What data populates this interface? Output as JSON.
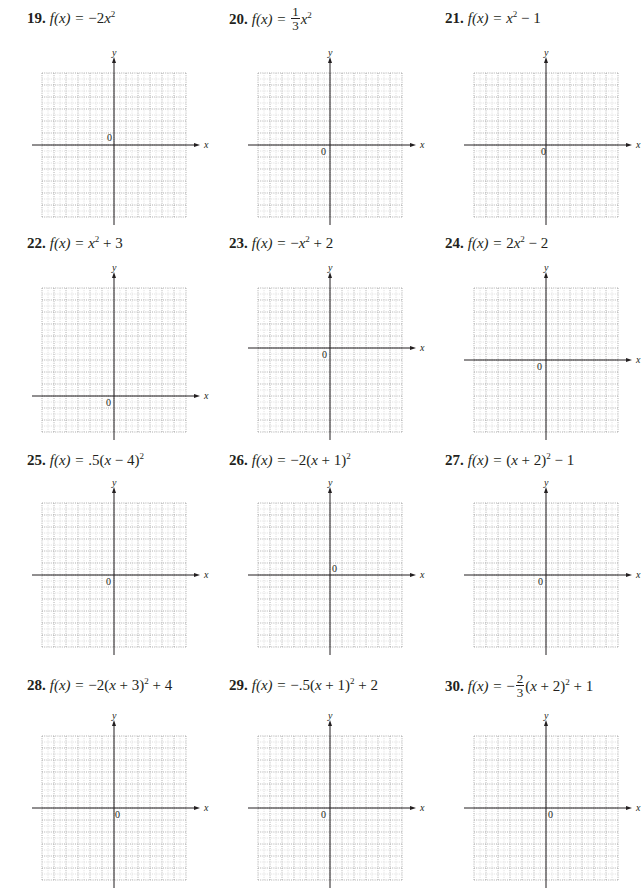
{
  "page": {
    "problems": [
      {
        "number": "19.",
        "lhs": "f(x) =",
        "parts": [
          "−2",
          "x",
          "2",
          ""
        ],
        "frac": null
      },
      {
        "number": "20.",
        "lhs": "f(x) =",
        "parts": [
          "",
          "x",
          "2",
          ""
        ],
        "frac": {
          "num": "1",
          "den": "3",
          "sign": ""
        }
      },
      {
        "number": "21.",
        "lhs": "f(x) =",
        "parts": [
          "",
          "x",
          "2",
          " − 1"
        ],
        "frac": null
      },
      {
        "number": "22.",
        "lhs": "f(x) =",
        "parts": [
          "",
          "x",
          "2",
          " + 3"
        ],
        "frac": null
      },
      {
        "number": "23.",
        "lhs": "f(x) =",
        "parts": [
          "−",
          "x",
          "2",
          " + 2"
        ],
        "frac": null
      },
      {
        "number": "24.",
        "lhs": "f(x) =",
        "parts": [
          "2",
          "x",
          "2",
          " − 2"
        ],
        "frac": null
      },
      {
        "number": "25.",
        "lhs": "f(x) =",
        "parts": [
          ".5(",
          "x",
          "2",
          ""
        ],
        "frac": null,
        "inner": " − 4)"
      },
      {
        "number": "26.",
        "lhs": "f(x) =",
        "parts": [
          "−2(",
          "x",
          "2",
          ""
        ],
        "frac": null,
        "inner": " + 1)"
      },
      {
        "number": "27.",
        "lhs": "f(x) =",
        "parts": [
          "(",
          "x",
          "2",
          " − 1"
        ],
        "frac": null,
        "inner": " + 2)"
      },
      {
        "number": "28.",
        "lhs": "f(x) =",
        "parts": [
          "−2(",
          "x",
          "2",
          " + 4"
        ],
        "frac": null,
        "inner": " + 3)"
      },
      {
        "number": "29.",
        "lhs": "f(x) =",
        "parts": [
          "−.5(",
          "x",
          "2",
          " + 2"
        ],
        "frac": null,
        "inner": " + 1)"
      },
      {
        "number": "30.",
        "lhs": "f(x) =",
        "parts": [
          "(",
          "x",
          "2",
          " + 1"
        ],
        "frac": {
          "num": "2",
          "den": "3",
          "sign": "−"
        },
        "inner": " + 2)"
      }
    ],
    "axis_labels": {
      "x": "x",
      "y": "y",
      "origin": "0"
    }
  },
  "chart_data": [
    {
      "type": "grid",
      "title": "19. f(x) = −2x²",
      "xlabel": "x",
      "ylabel": "y",
      "xlim": [
        -6,
        6
      ],
      "ylim": [
        -6,
        6
      ],
      "grid": true,
      "origin_label": "0"
    },
    {
      "type": "grid",
      "title": "20. f(x) = (1/3)x²",
      "xlabel": "x",
      "ylabel": "y",
      "xlim": [
        -6,
        6
      ],
      "ylim": [
        -6,
        6
      ],
      "grid": true,
      "origin_label": "0"
    },
    {
      "type": "grid",
      "title": "21. f(x) = x² − 1",
      "xlabel": "x",
      "ylabel": "y",
      "xlim": [
        -6,
        6
      ],
      "ylim": [
        -6,
        6
      ],
      "grid": true,
      "origin_label": "0"
    },
    {
      "type": "grid",
      "title": "22. f(x) = x² + 3",
      "xlabel": "x",
      "ylabel": "y",
      "xlim": [
        -6,
        6
      ],
      "ylim": [
        -3,
        9
      ],
      "grid": true,
      "origin_label": "0"
    },
    {
      "type": "grid",
      "title": "23. f(x) = −x² + 2",
      "xlabel": "x",
      "ylabel": "y",
      "xlim": [
        -6,
        6
      ],
      "ylim": [
        -7,
        5
      ],
      "grid": true,
      "origin_label": "0"
    },
    {
      "type": "grid",
      "title": "24. f(x) = 2x² − 2",
      "xlabel": "x",
      "ylabel": "y",
      "xlim": [
        -6,
        6
      ],
      "ylim": [
        -6,
        6
      ],
      "grid": true,
      "origin_label": "0"
    },
    {
      "type": "grid",
      "title": "25. f(x) = .5(x − 4)²",
      "xlabel": "x",
      "ylabel": "y",
      "xlim": [
        -6,
        6
      ],
      "ylim": [
        -6,
        6
      ],
      "grid": true,
      "origin_label": "0"
    },
    {
      "type": "grid",
      "title": "26. f(x) = −2(x + 1)²",
      "xlabel": "x",
      "ylabel": "y",
      "xlim": [
        -6,
        6
      ],
      "ylim": [
        -6,
        6
      ],
      "grid": true,
      "origin_label": "0"
    },
    {
      "type": "grid",
      "title": "27. f(x) = (x + 2)² − 1",
      "xlabel": "x",
      "ylabel": "y",
      "xlim": [
        -6,
        6
      ],
      "ylim": [
        -6,
        6
      ],
      "grid": true,
      "origin_label": "0"
    },
    {
      "type": "grid",
      "title": "28. f(x) = −2(x + 3)² + 4",
      "xlabel": "x",
      "ylabel": "y",
      "xlim": [
        -6,
        6
      ],
      "ylim": [
        -6,
        6
      ],
      "grid": true,
      "origin_label": "0"
    },
    {
      "type": "grid",
      "title": "29. f(x) = −.5(x + 1)² + 2",
      "xlabel": "x",
      "ylabel": "y",
      "xlim": [
        -6,
        6
      ],
      "ylim": [
        -6,
        6
      ],
      "grid": true,
      "origin_label": "0"
    },
    {
      "type": "grid",
      "title": "30. f(x) = −(2/3)(x + 2)² + 1",
      "xlabel": "x",
      "ylabel": "y",
      "xlim": [
        -6,
        6
      ],
      "ylim": [
        -6,
        6
      ],
      "grid": true,
      "origin_label": "0"
    }
  ]
}
